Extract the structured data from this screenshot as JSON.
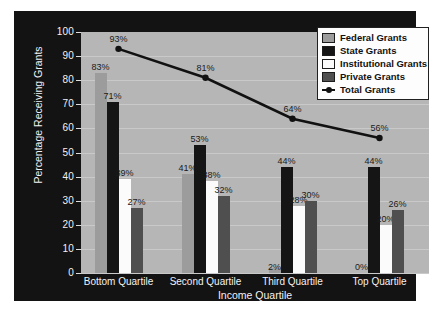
{
  "chart_data": {
    "type": "bar",
    "title": "",
    "xlabel": "Income Quartile",
    "ylabel": "Percentage Receiving Grants",
    "categories": [
      "Bottom Quartile",
      "Second Quartile",
      "Third Quartile",
      "Top Quartile"
    ],
    "ylim": [
      0,
      100
    ],
    "yticks": [
      "0",
      "10",
      "20",
      "30",
      "40",
      "50",
      "60",
      "70",
      "80",
      "90",
      "100"
    ],
    "grid": true,
    "legend_position": "top-right",
    "series": [
      {
        "name": "Federal Grants",
        "type": "bar",
        "color": "#9c9c9c",
        "values": [
          83,
          41,
          2,
          0
        ],
        "labels": [
          "83%",
          "41%",
          "2%",
          "0%"
        ]
      },
      {
        "name": "State Grants",
        "type": "bar",
        "color": "#151515",
        "values": [
          71,
          53,
          44,
          44
        ],
        "labels": [
          "71%",
          "53%",
          "44%",
          "44%"
        ]
      },
      {
        "name": "Institutional Grants",
        "type": "bar",
        "color": "#fbfbfb",
        "values": [
          39,
          38,
          28,
          20
        ],
        "labels": [
          "39%",
          "38%",
          "28%",
          "20%"
        ]
      },
      {
        "name": "Private Grants",
        "type": "bar",
        "color": "#4f4f4f",
        "values": [
          27,
          32,
          30,
          26
        ],
        "labels": [
          "27%",
          "32%",
          "30%",
          "26%"
        ]
      },
      {
        "name": "Total Grants",
        "type": "line",
        "color": "#111111",
        "values": [
          93,
          81,
          64,
          56
        ],
        "labels": [
          "93%",
          "81%",
          "64%",
          "56%"
        ]
      }
    ]
  },
  "legend": {
    "items": [
      {
        "label": "Federal Grants",
        "marker": "swatch",
        "color": "#9c9c9c"
      },
      {
        "label": "State Grants",
        "marker": "swatch",
        "color": "#151515"
      },
      {
        "label": "Institutional Grants",
        "marker": "swatch",
        "color": "#fbfbfb"
      },
      {
        "label": "Private Grants",
        "marker": "swatch",
        "color": "#4f4f4f"
      },
      {
        "label": "Total Grants",
        "marker": "line",
        "color": "#111111"
      }
    ]
  },
  "colors": {
    "panel_background": "#131313",
    "plot_background": "#b6b6b6",
    "gridline": "#c9c9c9",
    "axis_text": "#f2f2f2",
    "value_text": "#1a1a1a"
  }
}
